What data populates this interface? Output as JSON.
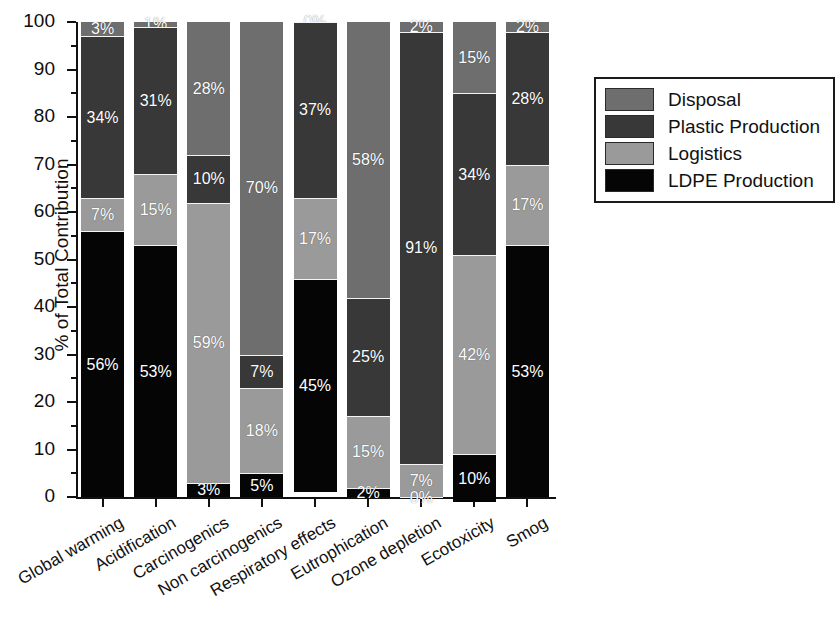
{
  "chart_data": {
    "type": "bar",
    "subtype": "stacked-bar-100-percent",
    "title": "",
    "xlabel": "",
    "ylabel": "% of Total Contribution",
    "ylim": [
      0,
      100
    ],
    "ytick_step": 10,
    "yminor_step": 5,
    "grid": false,
    "legend_position": "right",
    "value_suffix": "%",
    "categories": [
      "Global warming",
      "Acidification",
      "Carcinogenics",
      "Non carcinogenics",
      "Respiratory effects",
      "Eutrophication",
      "Ozone depletion",
      "Ecotoxicity",
      "Smog"
    ],
    "ytick_labels": [
      "0",
      "10",
      "20",
      "30",
      "40",
      "50",
      "60",
      "70",
      "80",
      "90",
      "100"
    ],
    "series": [
      {
        "name": "Disposal",
        "color": "#6e6e6e",
        "values": [
          3,
          1,
          28,
          70,
          0,
          58,
          2,
          15,
          2
        ]
      },
      {
        "name": "Plastic Production",
        "color": "#383838",
        "values": [
          34,
          31,
          10,
          7,
          37,
          25,
          91,
          34,
          28
        ]
      },
      {
        "name": "Logistics",
        "color": "#9a9a9a",
        "values": [
          7,
          15,
          59,
          18,
          17,
          15,
          7,
          42,
          17
        ]
      },
      {
        "name": "LDPE Production",
        "color": "#050505",
        "values": [
          56,
          53,
          3,
          5,
          45,
          2,
          0,
          10,
          53
        ]
      }
    ]
  },
  "legend": {
    "items": [
      {
        "label": "Disposal",
        "color": "#6e6e6e"
      },
      {
        "label": "Plastic Production",
        "color": "#383838"
      },
      {
        "label": "Logistics",
        "color": "#9a9a9a"
      },
      {
        "label": "LDPE Production",
        "color": "#050505"
      }
    ]
  }
}
